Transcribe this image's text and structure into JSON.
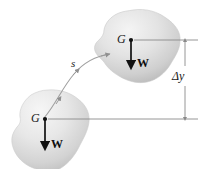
{
  "figure": {
    "name": "center-of-gravity-displacement-diagram",
    "background_color": "#ffffff",
    "width": 206,
    "height": 169
  },
  "labels": {
    "upper_body_center_of_gravity": "G",
    "lower_body_center_of_gravity": "G",
    "upper_weight_vector": "W",
    "lower_weight_vector": "W",
    "path_label": "s",
    "height_change": "Δy"
  },
  "bodies": [
    {
      "name": "upper-rigid-body",
      "fill_light": "#f0f0f0",
      "fill_mid": "#dcdcdc",
      "fill_dark": "#bdbdbd",
      "center_of_gravity_label": "G",
      "weight_label": "W"
    },
    {
      "name": "lower-rigid-body",
      "fill_light": "#f2f2f2",
      "fill_mid": "#e0e0e0",
      "fill_dark": "#c4c4c4",
      "center_of_gravity_label": "G",
      "weight_label": "W"
    }
  ],
  "annotations": {
    "path_curve_name": "displacement-path",
    "dimension_name": "delta-y-dimension",
    "extension_line_top": "upper-extension-line",
    "extension_line_bottom": "lower-extension-line"
  },
  "colors": {
    "vector_stroke": "#111111",
    "line_stroke": "#8a8a8a",
    "path_stroke": "#9a9a9a",
    "text": "#1a1a1a"
  }
}
